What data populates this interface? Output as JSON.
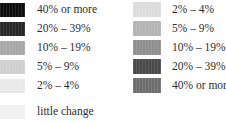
{
  "chart_data": {
    "type": "table",
    "title": "",
    "subtitle": "",
    "xlabel": "",
    "ylabel": "",
    "legend_position": "two-column",
    "grid": false,
    "columns": [
      {
        "name": "left",
        "order": "descending",
        "entries": [
          {
            "label": "40% or more",
            "color": "#0d0d0d",
            "value_min": 40,
            "value_max": null
          },
          {
            "label": "20% – 39%",
            "color": "#262626",
            "value_min": 20,
            "value_max": 39
          },
          {
            "label": "10% – 19%",
            "color": "#a8a8a8",
            "value_min": 10,
            "value_max": 19
          },
          {
            "label": "5% – 9%",
            "color": "#cfcfcf",
            "value_min": 5,
            "value_max": 9
          },
          {
            "label": "2% – 4%",
            "color": "#e9e9e9",
            "value_min": 2,
            "value_max": 4
          }
        ],
        "extra": [
          {
            "label": "little change",
            "color": "#f2f2f2",
            "value_min": null,
            "value_max": null
          }
        ]
      },
      {
        "name": "right",
        "order": "ascending",
        "entries": [
          {
            "label": "2% – 4%",
            "color": "#dcdcdc",
            "value_min": 2,
            "value_max": 4
          },
          {
            "label": "5% – 9%",
            "color": "#b4b4b4",
            "value_min": 5,
            "value_max": 9
          },
          {
            "label": "10% – 19%",
            "color": "#8f8f8f",
            "value_min": 10,
            "value_max": 19
          },
          {
            "label": "20% – 39%",
            "color": "#4a4a4a",
            "value_min": 20,
            "value_max": 39
          },
          {
            "label": "40% or more",
            "color": "#6e6e6e",
            "value_min": 40,
            "value_max": null
          }
        ],
        "extra": []
      }
    ]
  },
  "legend": {
    "left": {
      "rows": [
        {
          "label": "40% or more",
          "color": "#0d0d0d"
        },
        {
          "label": "20% – 39%",
          "color": "#262626"
        },
        {
          "label": "10% – 19%",
          "color": "#a8a8a8"
        },
        {
          "label": "5% – 9%",
          "color": "#cfcfcf"
        },
        {
          "label": "2% – 4%",
          "color": "#e9e9e9"
        }
      ],
      "extra_rows": [
        {
          "label": "little change",
          "color": "#f2f2f2"
        }
      ]
    },
    "right": {
      "rows": [
        {
          "label": "2% – 4%",
          "color": "#dcdcdc"
        },
        {
          "label": "5% – 9%",
          "color": "#b4b4b4"
        },
        {
          "label": "10% – 19%",
          "color": "#8f8f8f"
        },
        {
          "label": "20% – 39%",
          "color": "#4a4a4a"
        },
        {
          "label": "40% or more",
          "color": "#6e6e6e"
        }
      ],
      "extra_rows": []
    }
  }
}
